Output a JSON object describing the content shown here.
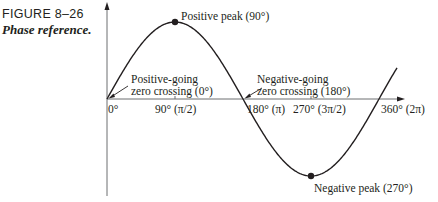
{
  "figure": {
    "number": "FIGURE 8–26",
    "title": "Phase reference."
  },
  "annotations": {
    "positive_peak": "Positive peak (90°)",
    "negative_peak": "Negative peak (270°)",
    "pos_zero_line1": "Positive-going",
    "pos_zero_line2": "zero crossing (0°)",
    "neg_zero_line1": "Negative-going",
    "neg_zero_line2": "zero crossing (180°)"
  },
  "x_ticks": [
    {
      "label": "0°",
      "x": 110
    },
    {
      "label": "90° (π/2)",
      "x": 157
    },
    {
      "label": "180° (π)",
      "x": 246
    },
    {
      "label": "270° (3π/2)",
      "x": 293
    },
    {
      "label": "360° (2π)",
      "x": 382
    }
  ],
  "colors": {
    "ink": "#231f20",
    "axis": "#6d6e71"
  },
  "chart_data": {
    "type": "line",
    "title": "Phase reference.",
    "xlabel": "",
    "ylabel": "",
    "x": [
      0,
      90,
      180,
      270,
      360
    ],
    "series": [
      {
        "name": "sine wave",
        "values": [
          0,
          1,
          0,
          -1,
          0
        ]
      }
    ],
    "x_tick_labels": [
      "0°",
      "90° (π/2)",
      "180° (π)",
      "270° (3π/2)",
      "360° (2π)"
    ],
    "annotations": [
      "Positive peak (90°)",
      "Negative peak (270°)",
      "Positive-going zero crossing (0°)",
      "Negative-going zero crossing (180°)"
    ],
    "grid": false
  }
}
